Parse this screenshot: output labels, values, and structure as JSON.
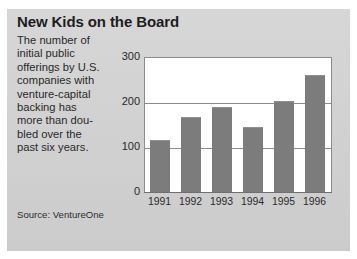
{
  "panel": {
    "title": "New Kids on the Board",
    "blurb_lines": [
      "The number of",
      "initial public",
      "offerings by U.S.",
      "companies with",
      "venture-capital",
      "backing has",
      "more than dou-",
      "bled over the",
      "past six years."
    ],
    "source": "Source: VentureOne",
    "background_color": "#d2d2d2"
  },
  "chart_data": {
    "type": "bar",
    "title": "New Kids on the Board",
    "subtitle": "The number of initial public offerings by U.S. companies with venture-capital backing has more than doubled over the past six years.",
    "categories": [
      "1991",
      "1992",
      "1993",
      "1994",
      "1995",
      "1996"
    ],
    "values": [
      118,
      168,
      192,
      147,
      205,
      262
    ],
    "series": [
      {
        "name": "Venture-backed IPOs",
        "values": [
          118,
          168,
          192,
          147,
          205,
          262
        ]
      }
    ],
    "xlabel": "",
    "ylabel": "",
    "ylim": [
      0,
      300
    ],
    "yticks": [
      0,
      100,
      200,
      300
    ],
    "ytick_labels": [
      "0",
      "100",
      "200",
      "300"
    ],
    "grid": true,
    "gridlines_at": [
      100,
      200,
      300
    ],
    "legend": false,
    "legend_position": "none",
    "bar_color": "#7c7c7c",
    "plot_background": "#ffffff",
    "source": "Source: VentureOne"
  }
}
